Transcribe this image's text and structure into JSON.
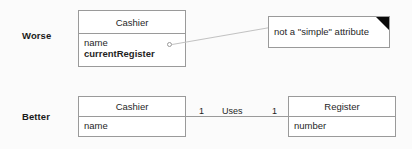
{
  "diagram": {
    "rows": {
      "worse": {
        "label": "Worse",
        "class_box": {
          "name": "Cashier",
          "attributes": [
            {
              "text": "name",
              "emphasis": "normal"
            },
            {
              "text": "currentRegister",
              "emphasis": "bold"
            }
          ]
        },
        "note": {
          "text": "not a \"simple\" attribute",
          "fold_color": "#0a0a0a"
        }
      },
      "better": {
        "label": "Better",
        "class_box_left": {
          "name": "Cashier",
          "attributes": [
            {
              "text": "name",
              "emphasis": "normal"
            }
          ]
        },
        "class_box_right": {
          "name": "Register",
          "attributes": [
            {
              "text": "number",
              "emphasis": "normal"
            }
          ]
        },
        "association": {
          "name": "Uses",
          "multiplicity_left": "1",
          "multiplicity_right": "1"
        }
      }
    },
    "colors": {
      "background": "#fbfbfb",
      "box_border": "#9a9a9a",
      "box_fill": "#ffffff",
      "text": "#1f1f1f",
      "connector": "#c2c2c2"
    }
  }
}
